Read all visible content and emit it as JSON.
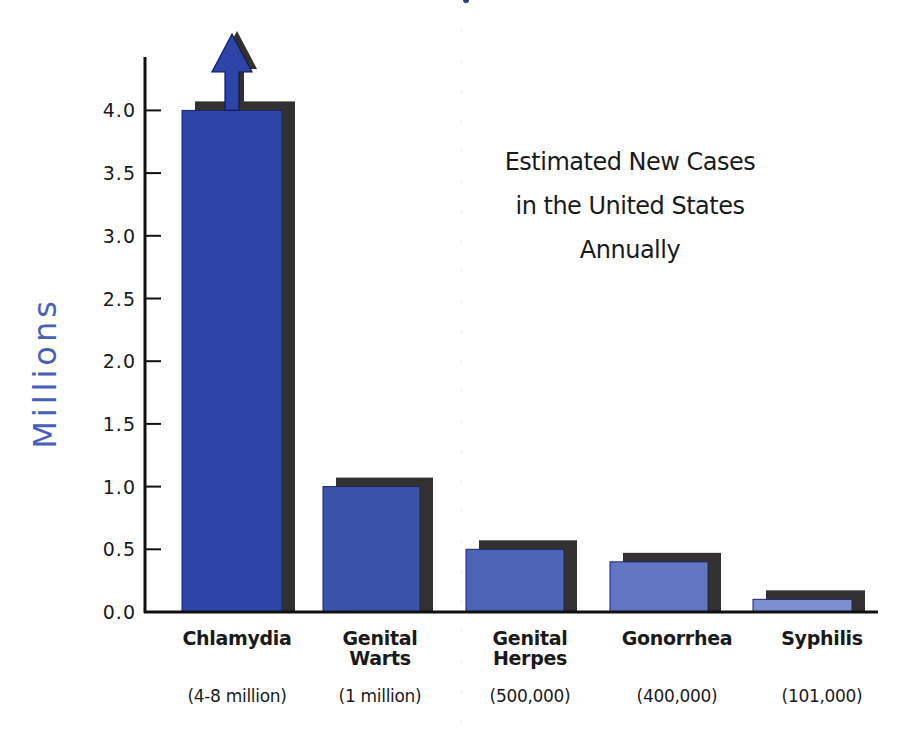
{
  "chart_data": {
    "type": "bar",
    "title": "Estimated New Cases in the United States Annually",
    "title_lines": [
      "Estimated New Cases",
      "in the United States",
      "Annually"
    ],
    "xlabel": "",
    "ylabel": "Millions",
    "ylim": [
      0,
      4.0
    ],
    "yticks": [
      "0.0",
      "0.5",
      "1.0",
      "1.5",
      "2.0",
      "2.5",
      "3.0",
      "3.5",
      "4.0"
    ],
    "grid": false,
    "legend": null,
    "categories": [
      "Chlamydia",
      "Genital Warts",
      "Genital Herpes",
      "Gonorrhea",
      "Syphilis"
    ],
    "category_lines": [
      [
        "Chlamydia"
      ],
      [
        "Genital",
        "Warts"
      ],
      [
        "Genital",
        "Herpes"
      ],
      [
        "Gonorrhea"
      ],
      [
        "Syphilis"
      ]
    ],
    "value_labels": [
      "(4-8 million)",
      "(1 million)",
      "(500,000)",
      "(400,000)",
      "(101,000)"
    ],
    "values": [
      4.0,
      1.0,
      0.5,
      0.4,
      0.101
    ],
    "annotations": [
      "Upward arrow on Chlamydia bar indicates value exceeds axis (4-8 million)"
    ],
    "bar_colors": [
      "#2d45a8",
      "#3a52aa",
      "#4c63b6",
      "#6275c2",
      "#7d8fd0"
    ],
    "shadow_color": "#333031"
  },
  "colors": {
    "axis": "#111111",
    "ylabel": "#4a5fb8",
    "text": "#1a1a1a"
  }
}
